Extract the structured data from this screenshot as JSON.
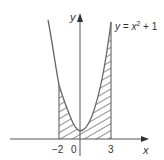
{
  "diagram": {
    "type": "function-graph",
    "equation_label": {
      "prefix": "y = x",
      "exponent": "2",
      "suffix": " + 1"
    },
    "axes": {
      "x_label": "x",
      "y_label": "y",
      "origin_label": "0"
    },
    "ticks": {
      "left": "−2",
      "right": "3"
    },
    "shaded_region": {
      "from": -2,
      "to": 3,
      "pattern": "diagonal-hatch",
      "description": "Area under y = x^2 + 1 between x = -2 and x = 3"
    },
    "colors": {
      "curve": "#666666",
      "axes": "#555555",
      "hatch": "#333333",
      "text": "#333333"
    }
  }
}
